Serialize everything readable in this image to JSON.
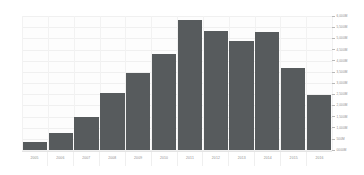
{
  "chart_data": {
    "type": "bar",
    "title": "",
    "subtitle": "",
    "xlabel": "",
    "ylabel": "",
    "categories": [
      "2005",
      "2006",
      "2007",
      "2008",
      "2009",
      "2010",
      "2011",
      "2012",
      "2013",
      "2014",
      "2015",
      "2016"
    ],
    "values": [
      370,
      750,
      1500,
      2550,
      3450,
      4300,
      5800,
      5350,
      4900,
      5300,
      3650,
      2450
    ],
    "ylim": [
      0,
      6000
    ],
    "yticks": [
      0,
      500,
      1000,
      1500,
      2000,
      2500,
      3000,
      3500,
      4000,
      4500,
      5000,
      5500,
      6000
    ],
    "ytick_labels": [
      "0000M",
      "500M",
      "1,000M",
      "1,500M",
      "2,000M",
      "2,500M",
      "3,000M",
      "3,500M",
      "4,000M",
      "4,500M",
      "5,000M",
      "5,500M",
      "6,000M"
    ],
    "grid": true,
    "legend": "none",
    "series": [
      {
        "name": "Value",
        "values": [
          370,
          750,
          1500,
          2550,
          3450,
          4300,
          5800,
          5350,
          4900,
          5300,
          3650,
          2450
        ]
      }
    ],
    "colors": {
      "bar": "#575b5d",
      "background": "#ffffff",
      "plot_background": "#fdfdfd",
      "gridline": "#f0f0f0",
      "tick_text": "#8a8a8a"
    }
  }
}
